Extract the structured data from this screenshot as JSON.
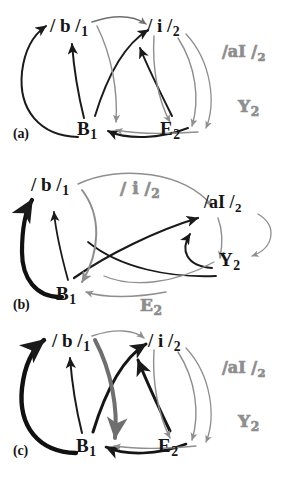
{
  "figure": {
    "colors": {
      "ink_black": "#151515",
      "arrow_black": "#1a1a1a",
      "arrow_gray": "#8e8e8e",
      "arrow_midgray": "#6f6f6f",
      "node_hollow_gray": "#8e8e8e",
      "background": "#ffffff"
    }
  },
  "panels": [
    {
      "id": "a",
      "caption": "(a)",
      "nodes": [
        {
          "id": "a-b",
          "text": "/ b /",
          "sub": "1",
          "style": "black"
        },
        {
          "id": "a-i",
          "text": "/ i /",
          "sub": "2",
          "style": "black"
        },
        {
          "id": "a-ai",
          "text": "/aI /",
          "sub": "2",
          "style": "hollow"
        },
        {
          "id": "a-y",
          "text": "Y",
          "sub": "2",
          "style": "hollow"
        },
        {
          "id": "a-B",
          "text": "B",
          "sub": "1",
          "style": "black"
        },
        {
          "id": "a-E",
          "text": "E",
          "sub": "2",
          "style": "black"
        }
      ]
    },
    {
      "id": "b",
      "caption": "(b)",
      "nodes": [
        {
          "id": "b-b",
          "text": "/ b /",
          "sub": "1",
          "style": "black"
        },
        {
          "id": "b-i",
          "text": "/ i /",
          "sub": "2",
          "style": "hollow"
        },
        {
          "id": "b-ai",
          "text": "/aI /",
          "sub": "2",
          "style": "black"
        },
        {
          "id": "b-y",
          "text": "Y",
          "sub": "2",
          "style": "black"
        },
        {
          "id": "b-B",
          "text": "B",
          "sub": "1",
          "style": "black"
        },
        {
          "id": "b-E",
          "text": "E",
          "sub": "2",
          "style": "hollow"
        }
      ]
    },
    {
      "id": "c",
      "caption": "(c)",
      "nodes": [
        {
          "id": "c-b",
          "text": "/ b /",
          "sub": "1",
          "style": "black"
        },
        {
          "id": "c-i",
          "text": "/ i /",
          "sub": "2",
          "style": "black"
        },
        {
          "id": "c-ai",
          "text": "/aI /",
          "sub": "2",
          "style": "hollow"
        },
        {
          "id": "c-y",
          "text": "Y",
          "sub": "2",
          "style": "hollow"
        },
        {
          "id": "c-B",
          "text": "B",
          "sub": "1",
          "style": "black"
        },
        {
          "id": "c-E",
          "text": "E",
          "sub": "2",
          "style": "black"
        }
      ]
    }
  ],
  "labels": {
    "a": {
      "b": "/ b /",
      "b_sub": "1",
      "i": "/ i /",
      "i_sub": "2",
      "ai": "/aI /",
      "ai_sub": "2",
      "y": "Y",
      "y_sub": "2",
      "B": "B",
      "B_sub": "1",
      "E": "E",
      "E_sub": "2",
      "caption": "(a)"
    },
    "b": {
      "b": "/ b /",
      "b_sub": "1",
      "i": "/ i /",
      "i_sub": "2",
      "ai": "/aI /",
      "ai_sub": "2",
      "y": "Y",
      "y_sub": "2",
      "B": "B",
      "B_sub": "1",
      "E": "E",
      "E_sub": "2",
      "caption": "(b)"
    },
    "c": {
      "b": "/ b /",
      "b_sub": "1",
      "i": "/ i /",
      "i_sub": "2",
      "ai": "/aI /",
      "ai_sub": "2",
      "y": "Y",
      "y_sub": "2",
      "B": "B",
      "B_sub": "1",
      "E": "E",
      "E_sub": "2",
      "caption": "(c)"
    }
  }
}
